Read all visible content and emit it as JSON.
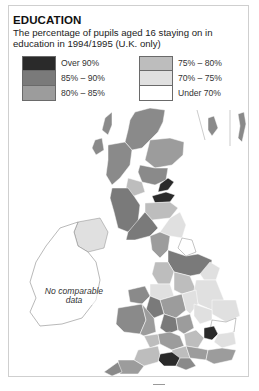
{
  "title": "EDUCATION",
  "subtitle": "The percentage of pupils aged 16 staying on in education in 1994/1995 (U.K. only)",
  "legend": {
    "left": [
      {
        "label": "Over 90%",
        "color": "#2a2a2a"
      },
      {
        "label": "85% – 90%",
        "color": "#7a7a7a"
      },
      {
        "label": "80% – 85%",
        "color": "#9c9c9c"
      }
    ],
    "right": [
      {
        "label": "75% – 80%",
        "color": "#bdbdbd"
      },
      {
        "label": "70% – 75%",
        "color": "#e0e0e0"
      },
      {
        "label": "Under 70%",
        "color": "#ffffff"
      }
    ]
  },
  "map": {
    "no_data_label": "No comparable data",
    "colors": {
      "over90": "#2a2a2a",
      "c85_90": "#7a7a7a",
      "c80_85": "#9c9c9c",
      "c75_80": "#bdbdbd",
      "c70_75": "#e0e0e0",
      "under70": "#ffffff",
      "outline": "#8a8a8a"
    }
  }
}
